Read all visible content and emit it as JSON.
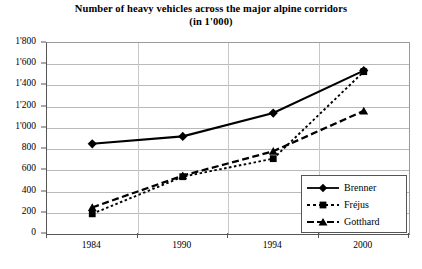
{
  "chart_data": {
    "type": "line",
    "title": "Number of heavy vehicles across the major alpine corridors",
    "subtitle": "(in 1'000)",
    "xlabel": "",
    "ylabel": "",
    "categories": [
      "1984",
      "1990",
      "1994",
      "2000"
    ],
    "series": [
      {
        "name": "Brenner",
        "values": [
          850,
          920,
          1140,
          1540
        ],
        "marker": "diamond",
        "line_style": "solid"
      },
      {
        "name": "Fréjus",
        "values": [
          190,
          540,
          710,
          1530
        ],
        "marker": "square",
        "line_style": "dotted"
      },
      {
        "name": "Gotthard",
        "values": [
          250,
          550,
          780,
          1160
        ],
        "marker": "triangle",
        "line_style": "dashed"
      }
    ],
    "ylim": [
      0,
      1800
    ],
    "yticks": [
      0,
      200,
      400,
      600,
      800,
      1000,
      1200,
      1400,
      1600,
      1800
    ],
    "ytick_labels": [
      "0",
      "200",
      "400",
      "600",
      "800",
      "1'000",
      "1'200",
      "1'400",
      "1'600",
      "1'800"
    ],
    "grid": true,
    "grid_axis": "y",
    "legend_position": "bottom-right",
    "series_color": "#000000",
    "grid_color": "#b9b9b9",
    "axis_color": "#555555",
    "background_color": "#ffffff"
  },
  "legend": {
    "items": [
      {
        "label": "Brenner"
      },
      {
        "label": "Fréjus"
      },
      {
        "label": "Gotthard"
      }
    ]
  }
}
